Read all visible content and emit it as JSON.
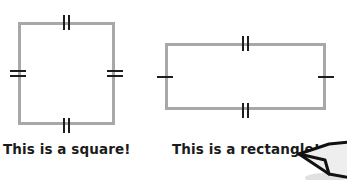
{
  "canvas": {
    "width": 347,
    "height": 180,
    "background_color": "#ffffff"
  },
  "style": {
    "shape_stroke_color": "#a8a8a8",
    "tick_color": "#1d1d1d",
    "caption_color": "#1b1b1b"
  },
  "figures": [
    {
      "id": "square",
      "shape_name": "square",
      "caption": "This is a square!",
      "geometry": {
        "x": 18,
        "y": 22,
        "width": 97,
        "height": 103
      },
      "tick_marks": {
        "top": 2,
        "bottom": 2,
        "left": 2,
        "right": 2
      },
      "meaning": "all four sides marked equal"
    },
    {
      "id": "rectangle",
      "shape_name": "rectangle",
      "caption": "This is a rectangle!",
      "geometry": {
        "x": 165,
        "y": 43,
        "width": 161,
        "height": 67
      },
      "tick_marks": {
        "top": 2,
        "bottom": 2,
        "left": 1,
        "right": 1
      },
      "meaning": "opposite sides marked equal in two pairs"
    }
  ],
  "decoration": {
    "corner_art_name": "clipped-cartoon-beak"
  }
}
